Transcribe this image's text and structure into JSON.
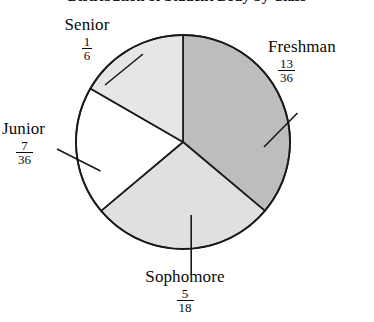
{
  "chart_data": {
    "type": "pie",
    "title": "Distribution of Student Body by Class",
    "title_clipped": true,
    "categories": [
      "Freshman",
      "Sophomore",
      "Junior",
      "Senior"
    ],
    "values": [
      0.3611,
      0.2778,
      0.1944,
      0.1667
    ],
    "value_labels": [
      "13/36",
      "5/18",
      "7/36",
      "1/6"
    ],
    "fractions": [
      {
        "name": "Freshman",
        "numerator": "13",
        "denominator": "36",
        "angle_deg": 130,
        "fill": "#bdbdbd"
      },
      {
        "name": "Sophomore",
        "numerator": "5",
        "denominator": "18",
        "angle_deg": 100,
        "fill": "#e0e0e0"
      },
      {
        "name": "Junior",
        "numerator": "7",
        "denominator": "36",
        "angle_deg": 70,
        "fill": "#ffffff"
      },
      {
        "name": "Senior",
        "numerator": "1",
        "denominator": "6",
        "angle_deg": 60,
        "fill": "#e6e6e6"
      }
    ],
    "start_angle_deg": 0,
    "direction": "clockwise",
    "legend": "none",
    "grid": false,
    "xlabel": "",
    "ylabel": "",
    "stroke_color": "#1a1a1a"
  },
  "labels": {
    "senior": {
      "name": "Senior",
      "numerator": "1",
      "denominator": "6"
    },
    "freshman": {
      "name": "Freshman",
      "numerator": "13",
      "denominator": "36"
    },
    "junior": {
      "name": "Junior",
      "numerator": "7",
      "denominator": "36"
    },
    "sophomore": {
      "name": "Sophomore",
      "numerator": "5",
      "denominator": "18"
    }
  }
}
